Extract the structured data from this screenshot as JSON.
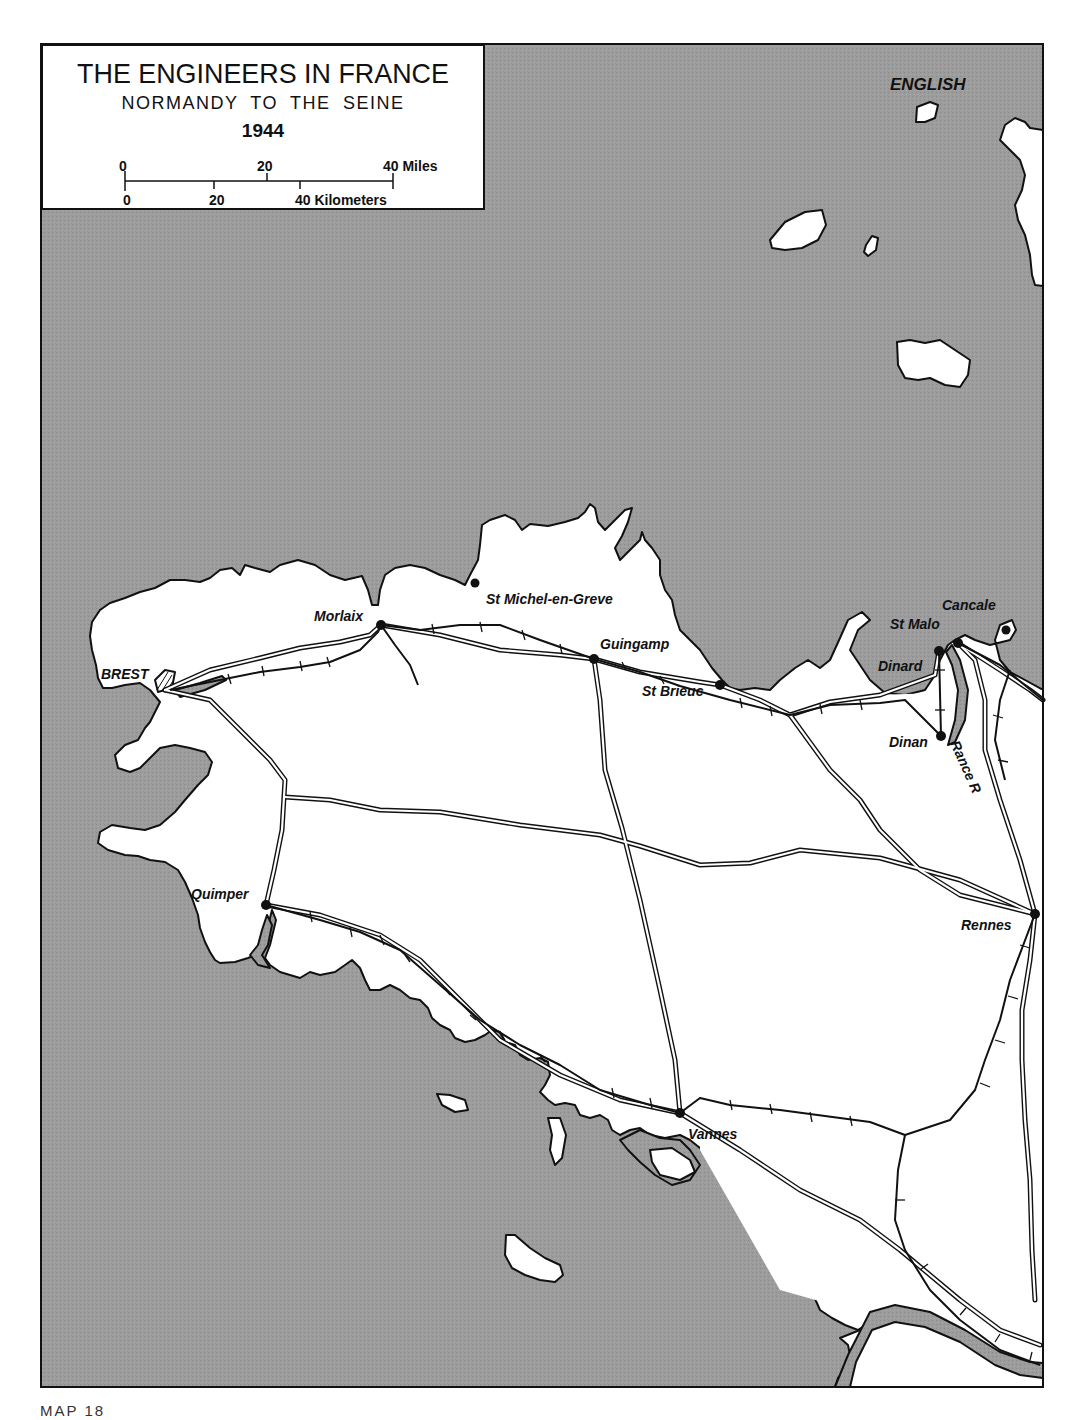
{
  "title_box": {
    "title": "THE ENGINEERS IN FRANCE",
    "subtitle": "NORMANDY TO THE SEINE",
    "year": "1944",
    "scale": {
      "miles_ticks": [
        "0",
        "20",
        "40 Miles"
      ],
      "km_ticks": [
        "0",
        "20",
        "40 Kilometers"
      ]
    }
  },
  "colors": {
    "sea": "#9a9a9a",
    "land": "#ffffff",
    "outline": "#111111",
    "frame": "#111111"
  },
  "labels": {
    "sea": "ENGLISH",
    "river": "Rance R"
  },
  "cities": [
    {
      "name": "BREST",
      "x": 101,
      "y": 666,
      "dotx": null,
      "doty": null,
      "style": "upper"
    },
    {
      "name": "Morlaix",
      "x": 314,
      "y": 611,
      "dotx": 381,
      "doty": 625
    },
    {
      "name": "St Michel-en-Greve",
      "x": 486,
      "y": 592,
      "dotx": 475,
      "doty": 583
    },
    {
      "name": "Guingamp",
      "x": 600,
      "y": 637,
      "dotx": 594,
      "doty": 659
    },
    {
      "name": "St Brieuc",
      "x": 642,
      "y": 684,
      "dotx": 720,
      "doty": 685
    },
    {
      "name": "Dinard",
      "x": 878,
      "y": 659,
      "dotx": 939,
      "doty": 651
    },
    {
      "name": "St Malo",
      "x": 890,
      "y": 617,
      "dotx": 958,
      "doty": 643
    },
    {
      "name": "Cancale",
      "x": 942,
      "y": 598,
      "dotx": 1006,
      "doty": 630
    },
    {
      "name": "Dinan",
      "x": 889,
      "y": 735,
      "dotx": 941,
      "doty": 736
    },
    {
      "name": "Quimper",
      "x": 191,
      "y": 887,
      "dotx": 266,
      "doty": 905
    },
    {
      "name": "Rennes",
      "x": 961,
      "y": 918,
      "dotx": 1035,
      "doty": 914
    },
    {
      "name": "Vannes",
      "x": 688,
      "y": 1127,
      "dotx": 680,
      "doty": 1113
    }
  ],
  "caption": "MAP 18"
}
